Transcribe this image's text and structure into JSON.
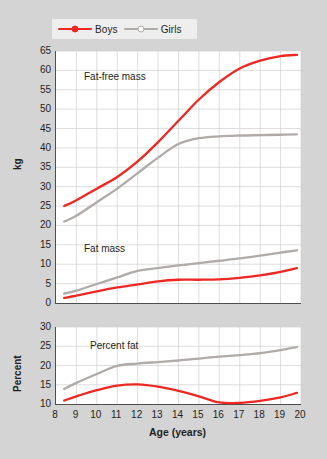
{
  "legend": {
    "position": "top-left",
    "entries": [
      {
        "label": "Boys",
        "color": "#ee2722",
        "marker": "filled-circle"
      },
      {
        "label": "Girls",
        "color": "#b0aaa8",
        "marker": "open-circle"
      }
    ]
  },
  "axes": {
    "x": {
      "label": "Age (years)",
      "ticks": [
        8,
        9,
        10,
        11,
        12,
        13,
        14,
        15,
        16,
        17,
        18,
        19,
        20
      ],
      "min": 8,
      "max": 20
    },
    "y_top": {
      "label": "kg",
      "ticks": [
        0,
        5,
        10,
        15,
        20,
        25,
        30,
        35,
        40,
        45,
        50,
        55,
        60,
        65
      ],
      "min": 0,
      "max": 65
    },
    "y_bottom": {
      "label": "Percent",
      "ticks": [
        10,
        15,
        20,
        25,
        30
      ],
      "min": 10,
      "max": 30
    }
  },
  "annotations": {
    "fat_free_mass": "Fat-free mass",
    "fat_mass": "Fat mass",
    "percent_fat": "Percent fat"
  },
  "chart_data": [
    {
      "type": "line",
      "title": "Fat-free mass",
      "panel": "top",
      "xlabel": "Age (years)",
      "ylabel": "kg",
      "xlim": [
        8,
        20
      ],
      "ylim": [
        0,
        65
      ],
      "grid": true,
      "x": [
        8.4,
        9,
        10,
        11,
        12,
        13,
        14,
        15,
        16,
        17,
        18,
        19,
        19.8
      ],
      "series": [
        {
          "name": "Boys",
          "color": "#ee2722",
          "values": [
            25.0,
            26.5,
            29.5,
            32.5,
            36.5,
            41.5,
            47.0,
            52.5,
            57.0,
            60.5,
            62.5,
            63.7,
            64.0
          ]
        },
        {
          "name": "Girls",
          "color": "#b0aaa8",
          "values": [
            21.0,
            22.5,
            26.0,
            29.5,
            33.5,
            37.5,
            41.0,
            42.5,
            43.0,
            43.2,
            43.3,
            43.4,
            43.5
          ]
        }
      ]
    },
    {
      "type": "line",
      "title": "Fat mass",
      "panel": "top",
      "xlabel": "Age (years)",
      "ylabel": "kg",
      "xlim": [
        8,
        20
      ],
      "ylim": [
        0,
        65
      ],
      "grid": true,
      "x": [
        8.4,
        9,
        10,
        11,
        12,
        13,
        14,
        15,
        16,
        17,
        18,
        19,
        19.8
      ],
      "series": [
        {
          "name": "Boys",
          "color": "#ee2722",
          "values": [
            1.3,
            1.9,
            3.0,
            4.0,
            4.8,
            5.6,
            6.0,
            6.0,
            6.1,
            6.5,
            7.1,
            8.0,
            9.0
          ]
        },
        {
          "name": "Girls",
          "color": "#b0aaa8",
          "values": [
            2.4,
            3.2,
            4.9,
            6.6,
            8.3,
            9.0,
            9.7,
            10.3,
            10.9,
            11.5,
            12.2,
            13.0,
            13.6
          ]
        }
      ]
    },
    {
      "type": "line",
      "title": "Percent fat",
      "panel": "bottom",
      "xlabel": "Age (years)",
      "ylabel": "Percent",
      "xlim": [
        8,
        20
      ],
      "ylim": [
        10,
        30
      ],
      "grid": true,
      "x": [
        8.4,
        9,
        10,
        11,
        12,
        13,
        14,
        15,
        16,
        17,
        18,
        19,
        19.8
      ],
      "series": [
        {
          "name": "Boys",
          "color": "#ee2722",
          "values": [
            10.9,
            12.0,
            13.6,
            14.8,
            15.1,
            14.5,
            13.4,
            12.0,
            10.4,
            10.3,
            10.8,
            11.7,
            12.9
          ]
        },
        {
          "name": "Girls",
          "color": "#b0aaa8",
          "values": [
            13.9,
            15.5,
            17.8,
            19.9,
            20.5,
            20.9,
            21.3,
            21.8,
            22.3,
            22.7,
            23.2,
            24.0,
            24.8
          ]
        }
      ]
    }
  ]
}
